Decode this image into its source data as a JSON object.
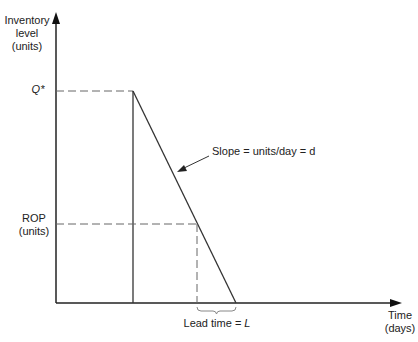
{
  "diagram": {
    "type": "inventory_sawtooth_rop",
    "y_axis_label": [
      "Inventory",
      "level",
      "(units)"
    ],
    "x_axis_label": [
      "Time",
      "(days)"
    ],
    "q_star_label": "Q*",
    "rop_label": [
      "ROP",
      "(units)"
    ],
    "slope_label": "Slope = units/day = d",
    "lead_time_label_prefix": "Lead time = ",
    "lead_time_symbol": "L",
    "colors": {
      "line": "#333333",
      "dashed": "#555555",
      "text": "#222222",
      "background": "#ffffff"
    }
  }
}
